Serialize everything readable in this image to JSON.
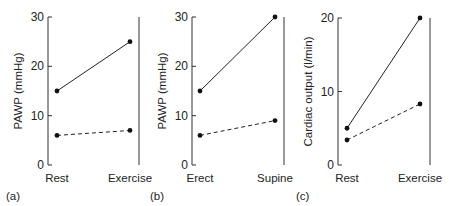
{
  "chart_data": [
    {
      "type": "line",
      "panel_label": "(a)",
      "categories": [
        "Rest",
        "Exercise"
      ],
      "ylabel": "PAWP (mmHg)",
      "xlabel": "",
      "ylim": [
        0,
        30
      ],
      "yticks": [
        0,
        10,
        20,
        30
      ],
      "series": [
        {
          "name": "solid",
          "style": "solid",
          "values": [
            15,
            25
          ]
        },
        {
          "name": "dashed",
          "style": "dashed",
          "values": [
            6,
            7
          ]
        }
      ]
    },
    {
      "type": "line",
      "panel_label": "(b)",
      "categories": [
        "Erect",
        "Supine"
      ],
      "ylabel": "PAWP (mmHg)",
      "xlabel": "",
      "ylim": [
        0,
        30
      ],
      "yticks": [
        0,
        10,
        20,
        30
      ],
      "series": [
        {
          "name": "solid",
          "style": "solid",
          "values": [
            15,
            30
          ]
        },
        {
          "name": "dashed",
          "style": "dashed",
          "values": [
            6,
            9
          ]
        }
      ]
    },
    {
      "type": "line",
      "panel_label": "(c)",
      "categories": [
        "Rest",
        "Exercise"
      ],
      "ylabel": "Cardiac output (l/min)",
      "xlabel": "",
      "ylim": [
        0,
        20
      ],
      "yticks": [
        0,
        10,
        20
      ],
      "series": [
        {
          "name": "solid",
          "style": "solid",
          "values": [
            5,
            20
          ]
        },
        {
          "name": "dashed",
          "style": "dashed",
          "values": [
            3.4,
            8.3
          ]
        }
      ]
    }
  ],
  "layout": {
    "panels": [
      {
        "axis_x": 48,
        "x0": 57,
        "x1": 130,
        "right_x": 139,
        "y_top": 17,
        "y_bottom": 165,
        "ylabel_x": 22,
        "label_x": 6
      },
      {
        "axis_x": 192,
        "x0": 200,
        "x1": 275,
        "right_x": 284,
        "y_top": 17,
        "y_bottom": 165,
        "ylabel_x": 166,
        "label_x": 150
      },
      {
        "axis_x": 338,
        "x0": 347,
        "x1": 420,
        "right_x": 430,
        "y_top": 18,
        "y_bottom": 165,
        "ylabel_x": 312,
        "label_x": 296
      }
    ]
  }
}
